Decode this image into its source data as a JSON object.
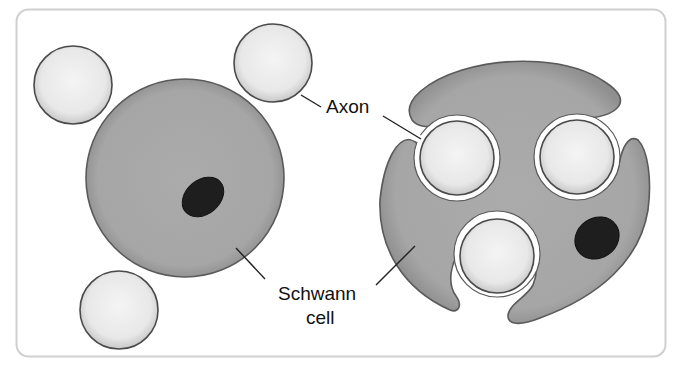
{
  "diagram": {
    "labels": {
      "axon": "Axon",
      "schwann_line1": "Schwann",
      "schwann_line2": "cell"
    },
    "colors": {
      "frame": "#cfcfcf",
      "schwann_fill": "#a9a9a9",
      "schwann_stroke": "#5a5a5a",
      "axon_fill": "#ececec",
      "axon_stroke": "#4a4a4a",
      "nucleus_fill": "#1e1e1e",
      "text": "#111111"
    },
    "panels": [
      {
        "name": "left",
        "description": "Schwann cell separate from three axons"
      },
      {
        "name": "right",
        "description": "Schwann cell enveloping three axons"
      }
    ]
  }
}
